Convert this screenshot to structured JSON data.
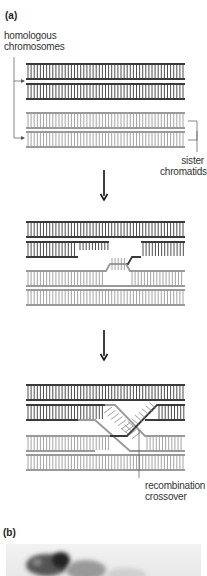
{
  "panel_a": {
    "label": "(a)",
    "homologous_label_line1": "homologous",
    "homologous_label_line2": "chromosomes",
    "sister_label_line1": "sister",
    "sister_label_line2": "chromatids",
    "crossover_label_line1": "recombination",
    "crossover_label_line2": "crossover"
  },
  "panel_b": {
    "label": "(b)"
  },
  "colors": {
    "dark_strand": "#3a3a3a",
    "light_strand": "#9a9a9a",
    "arrow": "#111111"
  },
  "stages": [
    "aligned homologous chromosomes",
    "strand invasion",
    "recombination crossover"
  ]
}
